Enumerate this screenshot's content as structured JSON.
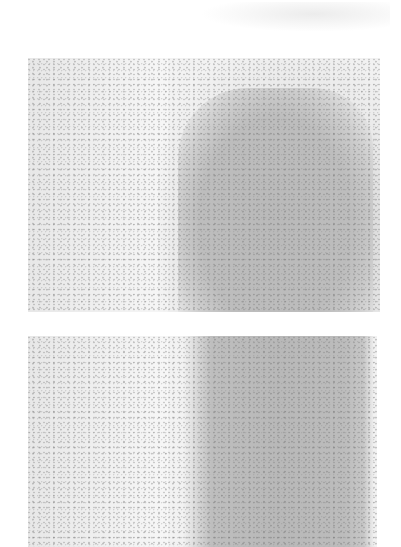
{
  "figure": {
    "panels": [
      {
        "id": "top",
        "description": "grayscale noisy field with darker rounded gray region at right"
      },
      {
        "id": "bottom",
        "description": "grayscale noisy field with darker vertical gray band at right"
      }
    ],
    "colors": {
      "background": "#ffffff",
      "light_field": "#f2f2f2",
      "dark_region": "#b9b9b9"
    }
  }
}
